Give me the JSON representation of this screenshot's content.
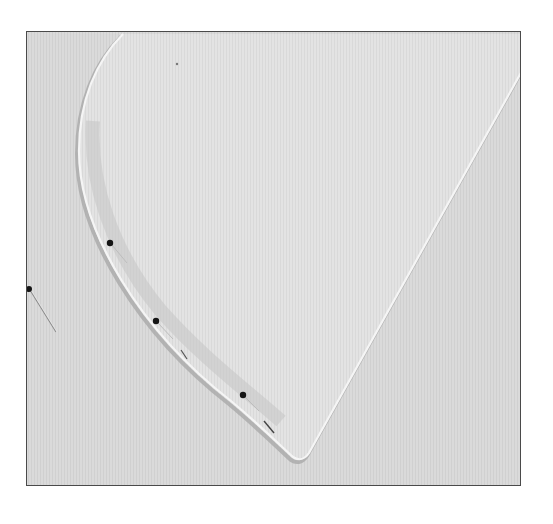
{
  "image": {
    "description": "Black-and-white photograph of a curved fabric piece pinned along its seam edge, on a fine-ribbed fabric background",
    "colors": {
      "background": "#dcdcdc",
      "fabric_piece": "#e2e2e2",
      "edge_highlight": "#f4f4f4",
      "edge_shadow": "#a8a8a8",
      "pin_head": "#151515",
      "frame_border": "#4a4a4a"
    },
    "pins": [
      {
        "label": "pin-1",
        "x": 109,
        "y": 242
      },
      {
        "label": "pin-2",
        "x": 155,
        "y": 320
      },
      {
        "label": "pin-3",
        "x": 242,
        "y": 394
      },
      {
        "label": "pin-outside",
        "x": 28,
        "y": 288
      }
    ]
  }
}
